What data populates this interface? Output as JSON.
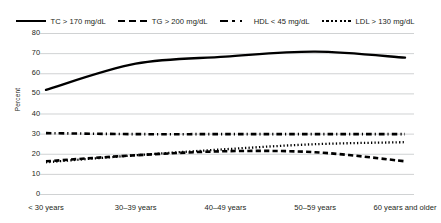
{
  "chart_data": {
    "type": "line",
    "title": "",
    "xlabel": "",
    "ylabel": "Percent",
    "ylim": [
      0,
      80
    ],
    "yticks": [
      0,
      10,
      20,
      30,
      40,
      50,
      60,
      70,
      80
    ],
    "grid": true,
    "legend_position": "top",
    "categories": [
      "< 30 years",
      "30–39 years",
      "40–49 years",
      "50–59 years",
      "60 years and older"
    ],
    "series": [
      {
        "name": "TC > 170 mg/dL",
        "style": "solid",
        "color": "#000000",
        "values": [
          52,
          65,
          68.5,
          71,
          68
        ]
      },
      {
        "name": "TG > 200 mg/dL",
        "style": "dashed",
        "color": "#000000",
        "values": [
          16.5,
          19.5,
          21.5,
          21,
          16.5
        ]
      },
      {
        "name": "HDL < 45 mg/dL",
        "style": "dashdot",
        "color": "#000000",
        "values": [
          30.5,
          30,
          30,
          30,
          30
        ]
      },
      {
        "name": "LDL > 130 mg/dL",
        "style": "dotted",
        "color": "#000000",
        "values": [
          16,
          19.5,
          22.5,
          25,
          26
        ]
      }
    ]
  },
  "axis": {
    "y_title": "Percent",
    "y_labels": [
      "80",
      "70",
      "60",
      "50",
      "40",
      "30",
      "20",
      "10",
      "0"
    ],
    "x_labels": [
      "< 30 years",
      "30–39 years",
      "40–49 years",
      "50–59 years",
      "60 years and older"
    ]
  },
  "legend": {
    "items": [
      {
        "label": "TC > 170 mg/dL",
        "style": "solid"
      },
      {
        "label": "TG > 200 mg/dL",
        "style": "dashed"
      },
      {
        "label": "HDL < 45 mg/dL",
        "style": "dashdot"
      },
      {
        "label": "LDL > 130 mg/dL",
        "style": "dotted"
      }
    ]
  },
  "colors": {
    "line": "#000000",
    "grid": "#bcbec0",
    "text": "#231f20",
    "background": "#ffffff"
  }
}
